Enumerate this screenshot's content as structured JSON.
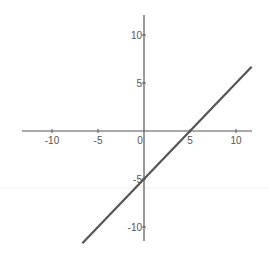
{
  "chart_data": {
    "type": "line",
    "title": "",
    "xlabel": "",
    "ylabel": "",
    "equation": "y = x - 5",
    "xlim": [
      -13,
      12
    ],
    "ylim": [
      -12,
      12
    ],
    "grid": false,
    "x_ticks": [
      -10,
      -5,
      0,
      5,
      10
    ],
    "y_ticks": [
      10,
      5,
      -5,
      -10
    ],
    "x_tick_labels": [
      "-10",
      "-5",
      "0",
      "5",
      "10"
    ],
    "y_tick_labels": [
      "10",
      "5",
      "-5",
      "-10"
    ],
    "series": [
      {
        "name": "line",
        "x": [
          -6.7,
          11.7
        ],
        "y": [
          -11.7,
          6.7
        ],
        "color": "#555555"
      }
    ],
    "x_intercept": 5,
    "y_intercept": -5
  },
  "colors": {
    "axis": "#555555",
    "line": "#555555",
    "label": "#555555",
    "background": "#ffffff"
  }
}
